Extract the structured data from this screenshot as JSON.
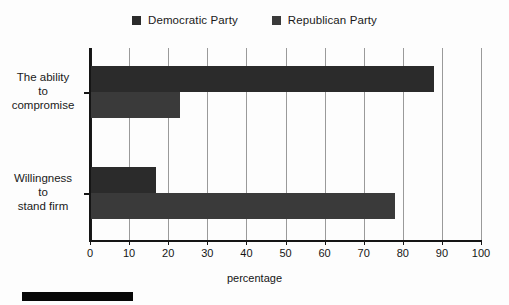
{
  "legend": {
    "position": "top-center",
    "entries": [
      {
        "label": "Democratic Party",
        "color": "#2b2b2b",
        "swatch": "square-marker"
      },
      {
        "label": "Republican Party",
        "color": "#3a3a3a",
        "swatch": "square-marker"
      }
    ]
  },
  "axes": {
    "x_title": "percentage",
    "x_ticks": [
      "0",
      "10",
      "20",
      "30",
      "40",
      "50",
      "60",
      "70",
      "80",
      "90",
      "100"
    ],
    "y_categories": [
      {
        "lines": [
          "The ability",
          "to",
          "compromise"
        ]
      },
      {
        "lines": [
          "Willingness",
          "to",
          "stand firm"
        ]
      }
    ]
  },
  "chart_data": {
    "type": "bar",
    "orientation": "horizontal",
    "title": "",
    "xlabel": "percentage",
    "ylabel": "",
    "xlim": [
      0,
      100
    ],
    "xticks": [
      0,
      10,
      20,
      30,
      40,
      50,
      60,
      70,
      80,
      90,
      100
    ],
    "grid": "vertical",
    "legend_position": "top-center",
    "categories": [
      "The ability to compromise",
      "Willingness to stand firm"
    ],
    "series": [
      {
        "name": "Democratic Party",
        "color": "#2b2b2b",
        "values": [
          88,
          17
        ]
      },
      {
        "name": "Republican Party",
        "color": "#3a3a3a",
        "values": [
          23,
          78
        ]
      }
    ]
  }
}
